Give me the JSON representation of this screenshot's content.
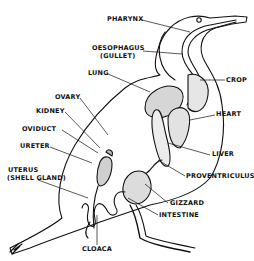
{
  "diagram": {
    "labels": {
      "pharynx": "PHARYNX",
      "oesophagus": "OESOPHAGUS",
      "gullet": "(GULLET)",
      "lung": "LUNG",
      "crop": "CROP",
      "ovary": "OVARY",
      "kidney": "KIDNEY",
      "heart": "HEART",
      "oviduct": "OVIDUCT",
      "ureter": "URETER",
      "liver": "LIVER",
      "uterus": "UTERUS",
      "shell_gland": "(SHELL GLAND)",
      "proventriculus": "PROVENTRICULUS",
      "gizzard": "GIZZARD",
      "intestine": "INTESTINE",
      "cloaca": "CLOACA"
    }
  }
}
